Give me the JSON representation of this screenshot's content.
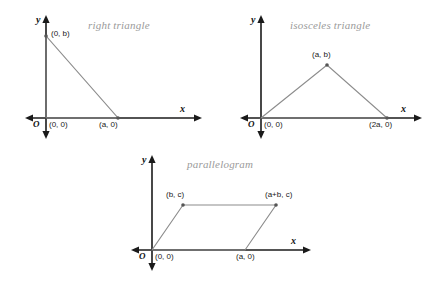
{
  "canvas": {
    "width": 428,
    "height": 281,
    "background": "#ffffff"
  },
  "style": {
    "axis_color": "#1a1a1a",
    "shape_color": "#8c8c8c",
    "title_color": "#9a9a9a",
    "label_color": "#1a1a1a",
    "vertex_dot_color": "#555555"
  },
  "figures": [
    {
      "id": "right-triangle",
      "title": "right triangle",
      "axis_x_label": "x",
      "axis_y_label": "y",
      "origin_label": "O",
      "vertices": [
        {
          "label": "(0, b)",
          "x": 0,
          "y": 1
        },
        {
          "label": "(0, 0)",
          "x": 0,
          "y": 0
        },
        {
          "label": "(a, 0)",
          "x": 1,
          "y": 0
        }
      ]
    },
    {
      "id": "isosceles-triangle",
      "title": "isosceles triangle",
      "axis_x_label": "x",
      "axis_y_label": "y",
      "origin_label": "O",
      "vertices": [
        {
          "label": "(0, 0)",
          "x": 0,
          "y": 0
        },
        {
          "label": "(a, b)",
          "x": 1,
          "y": 1
        },
        {
          "label": "(2a, 0)",
          "x": 2,
          "y": 0
        }
      ]
    },
    {
      "id": "parallelogram",
      "title": "parallelogram",
      "axis_x_label": "x",
      "axis_y_label": "y",
      "origin_label": "O",
      "vertices": [
        {
          "label": "(0, 0)",
          "x": 0,
          "y": 0
        },
        {
          "label": "(a, 0)",
          "x": 1,
          "y": 0
        },
        {
          "label": "(a+b, c)",
          "x": 2,
          "y": 1
        },
        {
          "label": "(b, c)",
          "x": 1,
          "y": 1
        }
      ]
    }
  ]
}
